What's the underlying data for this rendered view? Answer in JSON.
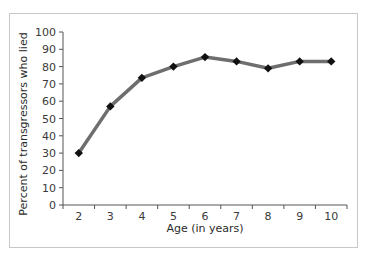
{
  "chart_data": {
    "type": "line",
    "title": "",
    "xlabel": "Age (in years)",
    "ylabel": "Percent of transgressors who lied",
    "categories": [
      "2",
      "3",
      "4",
      "5",
      "6",
      "7",
      "8",
      "9",
      "10"
    ],
    "series": [
      {
        "name": "Percent of transgressors who lied",
        "values": [
          30,
          57,
          73.5,
          80,
          85.5,
          83,
          79,
          83,
          83
        ]
      }
    ],
    "ylim": [
      0,
      100
    ],
    "yticks": [
      0,
      10,
      20,
      30,
      40,
      50,
      60,
      70,
      80,
      90,
      100
    ],
    "grid": false,
    "legend": "none",
    "colors": {
      "line": "#6e6e6e",
      "marker": "#111111",
      "axis": "#555555",
      "frame": "#c8c8c8"
    }
  }
}
